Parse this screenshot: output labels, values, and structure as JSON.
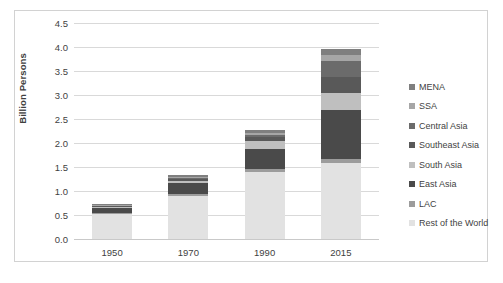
{
  "chart_data": {
    "type": "bar",
    "stacked": true,
    "title": "",
    "xlabel": "",
    "ylabel": "Billion Persons",
    "ylim": [
      0.0,
      4.5
    ],
    "ytick_step": 0.5,
    "yticks": [
      "0.0",
      "0.5",
      "1.0",
      "1.5",
      "2.0",
      "2.5",
      "3.0",
      "3.5",
      "4.0",
      "4.5"
    ],
    "grid": true,
    "legend_position": "right",
    "categories": [
      "1950",
      "1970",
      "1990",
      "2015"
    ],
    "stack_order_bottom_to_top": [
      "Rest of the World",
      "LAC",
      "East Asia",
      "South Asia",
      "Southeast Asia",
      "Central Asia",
      "SSA",
      "MENA"
    ],
    "series": [
      {
        "name": "MENA",
        "color": "#7f7f7f",
        "values": [
          0.015,
          0.03,
          0.055,
          0.125
        ]
      },
      {
        "name": "SSA",
        "color": "#a6a6a6",
        "values": [
          0.01,
          0.02,
          0.04,
          0.115
        ]
      },
      {
        "name": "Central Asia",
        "color": "#6b6b6b",
        "values": [
          0.012,
          0.025,
          0.045,
          0.33
        ]
      },
      {
        "name": "Southeast Asia",
        "color": "#595959",
        "values": [
          0.02,
          0.04,
          0.09,
          0.33
        ]
      },
      {
        "name": "South Asia",
        "color": "#bfbfbf",
        "values": [
          0.018,
          0.04,
          0.17,
          0.355
        ]
      },
      {
        "name": "East Asia",
        "color": "#4a4a4a",
        "values": [
          0.105,
          0.245,
          0.42,
          1.02
        ]
      },
      {
        "name": "LAC",
        "color": "#9c9c9c",
        "values": [
          0.02,
          0.035,
          0.06,
          0.085
        ]
      },
      {
        "name": "Rest of the World",
        "color": "#e2e2e2",
        "values": [
          0.53,
          0.895,
          1.39,
          1.59
        ]
      }
    ],
    "totals": [
      0.73,
      1.33,
      2.27,
      3.95
    ]
  },
  "legend": {
    "items": [
      {
        "label": "MENA"
      },
      {
        "label": "SSA"
      },
      {
        "label": "Central Asia"
      },
      {
        "label": "Southeast Asia"
      },
      {
        "label": "South Asia"
      },
      {
        "label": "East Asia"
      },
      {
        "label": "LAC"
      },
      {
        "label": "Rest of the World"
      }
    ]
  }
}
